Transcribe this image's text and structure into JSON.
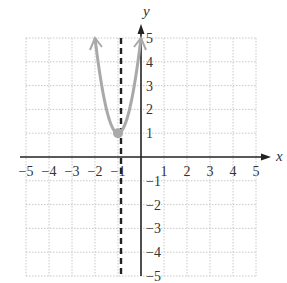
{
  "chart_data": {
    "type": "line",
    "title": "",
    "xlabel": "x",
    "ylabel": "y",
    "xlim": [
      -5,
      5
    ],
    "ylim": [
      -5,
      5
    ],
    "grid": true,
    "x_ticks": [
      "-5",
      "-4",
      "-3",
      "-2",
      "-1",
      "1",
      "2",
      "3",
      "4",
      "5"
    ],
    "y_ticks": [
      "5",
      "4",
      "3",
      "2",
      "1",
      "-1",
      "-2",
      "-3",
      "-4",
      "-5"
    ],
    "series": [
      {
        "name": "parabola",
        "equation": "y = 4(x + 1)^2 + 1",
        "color": "#a9a9a9",
        "vertex": [
          -1,
          1
        ],
        "points": [
          [
            -2,
            5
          ],
          [
            -1.5,
            2
          ],
          [
            -1,
            1
          ],
          [
            -0.5,
            2
          ],
          [
            0,
            5
          ]
        ],
        "arrows": "both ends"
      },
      {
        "name": "axis of symmetry",
        "style": "dashed",
        "color": "#222222",
        "x": -1
      }
    ]
  }
}
